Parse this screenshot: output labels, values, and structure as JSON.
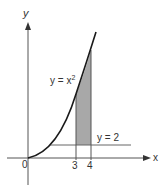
{
  "figure": {
    "axis_labels": {
      "x": "x",
      "y": "y"
    },
    "origin_label": "0",
    "ticks": [
      {
        "label": "3",
        "value": 3
      },
      {
        "label": "4",
        "value": 4
      }
    ],
    "curve_label": {
      "prefix": "y = x",
      "exponent": "2"
    },
    "line_label": "y = 2",
    "colors": {
      "axis": "#555555",
      "curve": "#1a1a1a",
      "shade": "#a8a8a8",
      "line": "#666666"
    }
  }
}
